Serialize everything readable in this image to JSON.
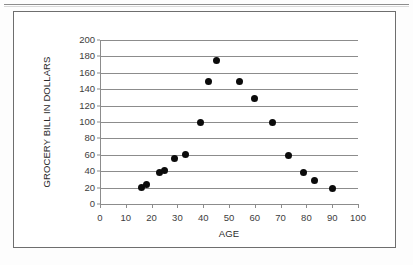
{
  "page": {
    "background_color": "#fdfdfd",
    "rule_color": "#8d8d8d"
  },
  "chart_frame": {
    "border_color": "#6e6e6e",
    "background_color": "#ffffff"
  },
  "chart_data": {
    "type": "scatter",
    "title": "",
    "subtitle": "",
    "xlabel": "AGE",
    "ylabel": "GROCERY BILL IN DOLLARS",
    "xlim": [
      0,
      100
    ],
    "ylim": [
      0,
      200
    ],
    "xticks": [
      0,
      10,
      20,
      30,
      40,
      50,
      60,
      70,
      80,
      90,
      100
    ],
    "yticks": [
      0,
      20,
      40,
      60,
      80,
      100,
      120,
      140,
      160,
      180,
      200
    ],
    "xtick_labels": [
      "0",
      "10",
      "20",
      "30",
      "40",
      "50",
      "60",
      "70",
      "80",
      "90",
      "100"
    ],
    "ytick_labels": [
      "0",
      "20",
      "40",
      "60",
      "80",
      "100",
      "120",
      "140",
      "160",
      "180",
      "200"
    ],
    "grid": "horizontal",
    "grid_color": "#8c8c8c",
    "legend": "none",
    "marker_color": "#0b0b0b",
    "marker_shape": "circle",
    "marker_size_px": 7,
    "series": [
      {
        "name": "Grocery bill vs age",
        "points": [
          {
            "x": 16,
            "y": 20
          },
          {
            "x": 18,
            "y": 24
          },
          {
            "x": 23,
            "y": 39
          },
          {
            "x": 25,
            "y": 41
          },
          {
            "x": 29,
            "y": 55
          },
          {
            "x": 33,
            "y": 60
          },
          {
            "x": 39,
            "y": 100
          },
          {
            "x": 42,
            "y": 150
          },
          {
            "x": 45,
            "y": 175
          },
          {
            "x": 54,
            "y": 150
          },
          {
            "x": 60,
            "y": 129
          },
          {
            "x": 67,
            "y": 100
          },
          {
            "x": 73,
            "y": 59
          },
          {
            "x": 79,
            "y": 39
          },
          {
            "x": 83,
            "y": 29
          },
          {
            "x": 90,
            "y": 19
          }
        ]
      }
    ]
  }
}
